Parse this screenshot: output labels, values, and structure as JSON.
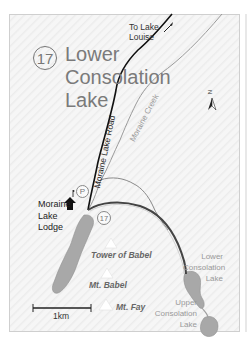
{
  "map": {
    "route_number": "17",
    "title": "Lower Consolation Lake",
    "labels": {
      "to_lake_louise": "To Lake Louise",
      "road": "Moraine Lake Road",
      "creek": "Moraine Creek",
      "lodge": "Moraine Lake Lodge",
      "moraine_lake": "Moraine Lake",
      "tower_of_babel": "Tower of Babel",
      "mt_babel": "Mt. Babel",
      "mt_fay": "Mt. Fay",
      "lower_consolation_lake": "Lower Consolation Lake",
      "upper_consolation_lake": "Upper Consolation Lake",
      "parking": "P",
      "trailhead_number": "17",
      "north": "N"
    },
    "scale": {
      "label": "1km"
    },
    "colors": {
      "road": "#111111",
      "creek": "#9a9a9a",
      "trail": "#555555",
      "lake": "#a8a8a8",
      "title": "#7a7a7a",
      "peak": "#ffffff"
    },
    "icons": [
      "north-arrow-icon",
      "parking-icon",
      "lodge-icon",
      "peak-icon",
      "trailhead-icon",
      "direction-arrow-icon"
    ]
  }
}
